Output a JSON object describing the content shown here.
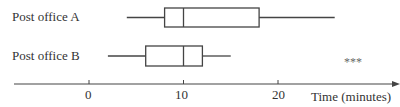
{
  "chart_data": {
    "type": "boxplot",
    "title": "",
    "xlabel": "Time (minutes)",
    "ylabel": "",
    "xlim": [
      -9,
      31
    ],
    "x_ticks": [
      0,
      10,
      20
    ],
    "x_tick_labels": [
      "0",
      "10",
      "20"
    ],
    "grid": false,
    "legend": null,
    "series": [
      {
        "name": "Post office A",
        "min": 4,
        "q1": 8,
        "median": 10,
        "q3": 18,
        "max": 26
      },
      {
        "name": "Post office B",
        "min": 2,
        "q1": 6,
        "median": 10,
        "q3": 12,
        "max": 15
      }
    ],
    "annotations": [
      "***"
    ]
  },
  "labels": {
    "row_a": "Post office A",
    "row_b": "Post office B",
    "axis_title": "Time (minutes)",
    "tick_0": "0",
    "tick_10": "10",
    "tick_20": "20",
    "annotation": "***"
  },
  "colors": {
    "stroke": "#444444",
    "text": "#333333"
  }
}
